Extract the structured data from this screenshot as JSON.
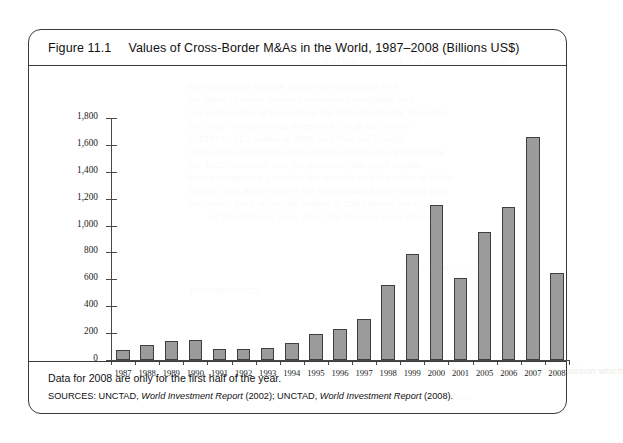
{
  "figure": {
    "label": "Figure 11.1",
    "title": "Values of Cross-Border M&As in the World, 1987–2008 (Billions US$)",
    "note": "Data for 2008 are only for the first half of the year.",
    "sources_prefix": "SOURCES: UNCTAD,",
    "sources_report1": "World Investment Report",
    "sources_mid": "(2002); UNCTAD,",
    "sources_report2": "World Investment Report",
    "sources_suffix": "(2008).",
    "bar_color": "#9b9b9b",
    "bar_border_color": "#3f3f3f",
    "frame_color": "#3a3a3a"
  },
  "chart_data": {
    "type": "bar",
    "title": "Values of Cross-Border M&As in the World, 1987–2008 (Billions US$)",
    "xlabel": "",
    "ylabel": "",
    "ylim": [
      0,
      1800
    ],
    "ytick_values": [
      0,
      200,
      400,
      600,
      800,
      1000,
      1200,
      1400,
      1600,
      1800
    ],
    "ytick_labels": [
      "0",
      "200",
      "400",
      "600",
      "800",
      "1,000",
      "1,200",
      "1,400",
      "1,600",
      "1,800"
    ],
    "grid": false,
    "legend": "none",
    "units": "Billions US$",
    "categories": [
      "1987",
      "1988",
      "1989",
      "1990",
      "1991",
      "1992",
      "1993",
      "1994",
      "1995",
      "1996",
      "1997",
      "1998",
      "1999",
      "2000",
      "2001",
      "2005",
      "2006",
      "2007",
      "2008"
    ],
    "values": [
      75,
      115,
      140,
      150,
      85,
      80,
      90,
      125,
      190,
      230,
      305,
      555,
      785,
      1150,
      610,
      950,
      1140,
      1660,
      650
    ]
  },
  "bleed_text": [
    {
      "x": 300,
      "y": 44,
      "text": "the nature of a first in the company control the"
    },
    {
      "x": 300,
      "y": 56,
      "text": "control of the operations of foreign companies to"
    },
    {
      "x": 188,
      "y": 82,
      "text": "the acquisition and the merger of enterprises in a"
    },
    {
      "x": 188,
      "y": 95,
      "text": "the value of cross-border transactions worldwide has"
    },
    {
      "x": 188,
      "y": 108,
      "text": "rise in the value of M&As from the Organization for Economic"
    },
    {
      "x": 188,
      "y": 121,
      "text": "the 2001 recession was a result of the global market"
    },
    {
      "x": 188,
      "y": 134,
      "text": "in 1987 to $1.2 trillion in 2000 and then fell sharply"
    },
    {
      "x": 188,
      "y": 147,
      "text": "much of the reduction in the overall volume of a global trade"
    },
    {
      "x": 188,
      "y": 160,
      "text": "the 2001 recession and the decline in the stock market"
    },
    {
      "x": 188,
      "y": 173,
      "text": "than a company's growth in the decade and the value of deals"
    },
    {
      "x": 188,
      "y": 186,
      "text": "figures once again rose in the mid-decade before falling back"
    },
    {
      "x": 188,
      "y": 199,
      "text": "the record level of merger activity in 2007 before the crisis"
    },
    {
      "x": 210,
      "y": 212,
      "text": "of the following year, when the financial crisis began"
    },
    {
      "x": 400,
      "y": 264,
      "text": "THE CORPORATION"
    },
    {
      "x": 190,
      "y": 286,
      "text": "NOITAROPROC"
    },
    {
      "x": 300,
      "y": 366,
      "text": "and all 2008 cited matters and effects of a merger of main acquisition which"
    },
    {
      "x": 345,
      "y": 392,
      "text": "the consolidation of corporate"
    }
  ]
}
